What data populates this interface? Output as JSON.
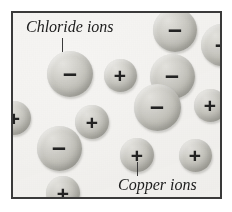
{
  "figure": {
    "background_color": "#f6f5f3",
    "border_color": "#3a3a3a",
    "ion_fill_color": "#c9c8c2",
    "text_color": "#1d1d1d"
  },
  "labels": [
    {
      "id": "chloride",
      "text": "Chloride ions",
      "x": 26,
      "y": 18,
      "leader": {
        "x": 62,
        "y": 38,
        "height": 14
      }
    },
    {
      "id": "copper",
      "text": "Copper ions",
      "x": 118,
      "y": 176,
      "leader": {
        "x": 137,
        "y": 162,
        "height": 14
      }
    }
  ],
  "ions": [
    {
      "name": "chloride-ion",
      "sign": "–",
      "size": "big",
      "cx": 70,
      "cy": 74,
      "d": 46
    },
    {
      "name": "chloride-ion",
      "sign": "–",
      "size": "big",
      "cx": 175,
      "cy": 30,
      "d": 44
    },
    {
      "name": "chloride-ion",
      "sign": "–",
      "size": "big",
      "cx": 222,
      "cy": 45,
      "d": 42
    },
    {
      "name": "chloride-ion",
      "sign": "–",
      "size": "big",
      "cx": 172,
      "cy": 76,
      "d": 45
    },
    {
      "name": "chloride-ion",
      "sign": "–",
      "size": "big",
      "cx": 157,
      "cy": 107,
      "d": 47
    },
    {
      "name": "chloride-ion",
      "sign": "–",
      "size": "big",
      "cx": 59,
      "cy": 148,
      "d": 45
    },
    {
      "name": "copper-ion",
      "sign": "+",
      "size": "small",
      "cx": 120,
      "cy": 75,
      "d": 33
    },
    {
      "name": "copper-ion",
      "sign": "+",
      "size": "small",
      "cx": 14,
      "cy": 118,
      "d": 34
    },
    {
      "name": "copper-ion",
      "sign": "+",
      "size": "small",
      "cx": 210,
      "cy": 105,
      "d": 33
    },
    {
      "name": "copper-ion",
      "sign": "+",
      "size": "small",
      "cx": 92,
      "cy": 122,
      "d": 34
    },
    {
      "name": "copper-ion",
      "sign": "+",
      "size": "small",
      "cx": 137,
      "cy": 155,
      "d": 34
    },
    {
      "name": "copper-ion",
      "sign": "+",
      "size": "small",
      "cx": 195,
      "cy": 155,
      "d": 33
    },
    {
      "name": "copper-ion",
      "sign": "+",
      "size": "small",
      "cx": 63,
      "cy": 193,
      "d": 34
    }
  ]
}
